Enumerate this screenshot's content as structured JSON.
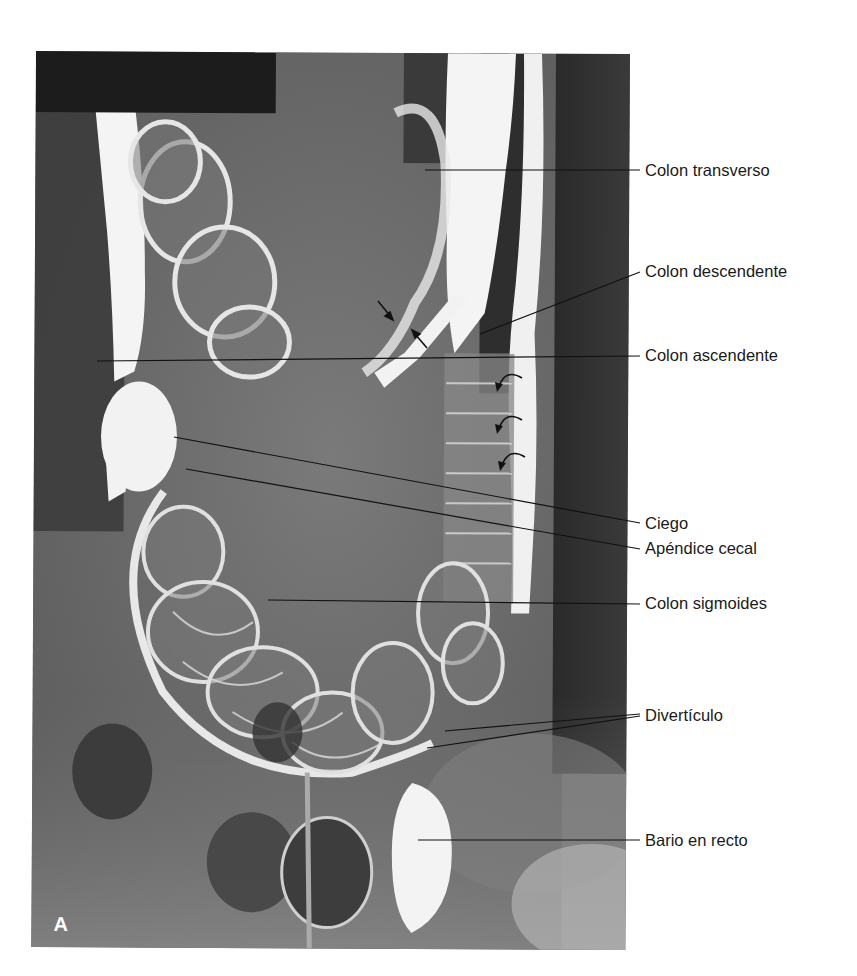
{
  "figure": {
    "panel_letter": "A",
    "labels": [
      {
        "id": "colon-transverso",
        "text": "Colon transverso",
        "x": 645,
        "y": 162
      },
      {
        "id": "colon-descendente",
        "text": "Colon descendente",
        "x": 645,
        "y": 263
      },
      {
        "id": "colon-ascendente",
        "text": "Colon ascendente",
        "x": 645,
        "y": 347
      },
      {
        "id": "ciego",
        "text": "Ciego",
        "x": 645,
        "y": 515
      },
      {
        "id": "apendice-cecal",
        "text": "Apéndice cecal",
        "x": 645,
        "y": 540
      },
      {
        "id": "colon-sigmoides",
        "text": "Colon sigmoides",
        "x": 645,
        "y": 595
      },
      {
        "id": "diverticulo",
        "text": "Divertículo",
        "x": 645,
        "y": 707
      },
      {
        "id": "bario-en-recto",
        "text": "Bario en recto",
        "x": 645,
        "y": 832
      }
    ],
    "leader_lines": [
      {
        "label": "colon-transverso",
        "x1": 425,
        "y1": 170,
        "x2": 640,
        "y2": 170
      },
      {
        "label": "colon-descendente",
        "x1": 480,
        "y1": 334,
        "x2": 640,
        "y2": 272
      },
      {
        "label": "colon-ascendente",
        "x1": 97,
        "y1": 361,
        "x2": 640,
        "y2": 356
      },
      {
        "label": "ciego",
        "x1": 174,
        "y1": 437,
        "x2": 640,
        "y2": 523
      },
      {
        "label": "apendice-cecal",
        "x1": 186,
        "y1": 469,
        "x2": 640,
        "y2": 549
      },
      {
        "label": "colon-sigmoides",
        "x1": 268,
        "y1": 600,
        "x2": 640,
        "y2": 604
      },
      {
        "label": "diverticulo",
        "x1": 445,
        "y1": 731,
        "x2": 640,
        "y2": 714
      },
      {
        "label": "diverticulo",
        "x1": 427,
        "y1": 748,
        "x2": 640,
        "y2": 716
      },
      {
        "label": "bario-en-recto",
        "x1": 418,
        "x2": 640,
        "y1": 840,
        "y2": 840
      }
    ],
    "arrows": {
      "straight": [
        {
          "x1": 378,
          "y1": 301,
          "x2": 392,
          "y2": 318
        },
        {
          "x1": 427,
          "y1": 348,
          "x2": 414,
          "y2": 333
        }
      ],
      "curved": [
        {
          "x": 500,
          "y": 385
        },
        {
          "x": 500,
          "y": 425
        },
        {
          "x": 503,
          "y": 462
        }
      ]
    },
    "colors": {
      "background": "#ffffff",
      "label_text": "#1a1a1a",
      "leader_line": "#111111",
      "barium": "#f2f2f2",
      "soft_tissue": "#6b6b6b",
      "redaction": "#1c1c1c"
    }
  }
}
